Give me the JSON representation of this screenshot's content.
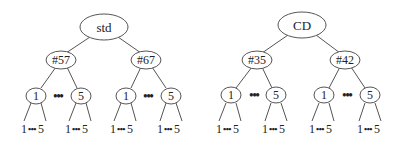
{
  "trees": [
    {
      "root": "std",
      "children": [
        {
          "label": "#57",
          "first_child": "1",
          "last_child": "5",
          "ellipsis": "•••",
          "leaves": [
            {
              "first": "1",
              "dots": "•••",
              "last": "5"
            },
            {
              "first": "1",
              "dots": "•••",
              "last": "5"
            }
          ]
        },
        {
          "label": "#67",
          "first_child": "1",
          "last_child": "5",
          "ellipsis": "•••",
          "leaves": [
            {
              "first": "1",
              "dots": "•••",
              "last": "5"
            },
            {
              "first": "1",
              "dots": "•••",
              "last": "5"
            }
          ]
        }
      ]
    },
    {
      "root": "CD",
      "children": [
        {
          "label": "#35",
          "first_child": "1",
          "last_child": "5",
          "ellipsis": "•••",
          "leaves": [
            {
              "first": "1",
              "dots": "•••",
              "last": "5"
            },
            {
              "first": "1",
              "dots": "•••",
              "last": "5"
            }
          ]
        },
        {
          "label": "#42",
          "first_child": "1",
          "last_child": "5",
          "ellipsis": "•••",
          "leaves": [
            {
              "first": "1",
              "dots": "•••",
              "last": "5"
            },
            {
              "first": "1",
              "dots": "•••",
              "last": "5"
            }
          ]
        }
      ]
    }
  ]
}
